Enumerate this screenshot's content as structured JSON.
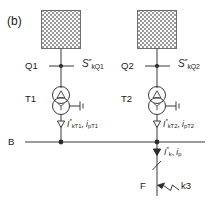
{
  "figure": {
    "panel_label": "(b)",
    "caption_absent": true
  },
  "colors": {
    "line": "#3a3a3a",
    "text": "#1a1a1a",
    "hatch": "#8a8a8a",
    "background": "#ffffff"
  },
  "sources": [
    {
      "id": "source-left",
      "network_symbol": "hatched-box",
      "node_label": "Q1",
      "power_label": {
        "symbol": "S",
        "sup": "″",
        "sub": "kQ1"
      },
      "power_label_text": "S″kQ1"
    },
    {
      "id": "source-right",
      "network_symbol": "hatched-box",
      "node_label": "Q2",
      "power_label": {
        "symbol": "S",
        "sup": "″",
        "sub": "kQ2"
      },
      "power_label_text": "S″kQ2"
    }
  ],
  "transformers": [
    {
      "id": "transformer-t1",
      "label": "T1",
      "winding_top": "delta",
      "winding_bottom": "wye",
      "earthed": true,
      "branch_current": {
        "short_circuit": {
          "symbol": "I",
          "sup": "″",
          "sub": "kT1"
        },
        "peak": {
          "symbol": "i",
          "sub": "pT1"
        },
        "text": "I″kT1, ipT1"
      }
    },
    {
      "id": "transformer-t2",
      "label": "T2",
      "winding_top": "delta",
      "winding_bottom": "wye",
      "earthed": true,
      "branch_current": {
        "short_circuit": {
          "symbol": "I",
          "sup": "″",
          "sub": "kT2"
        },
        "peak": {
          "symbol": "i",
          "sub": "pT2"
        },
        "text": "I″kT2, ipT2"
      }
    }
  ],
  "busbar": {
    "label": "B",
    "name": "busbar"
  },
  "total_current": {
    "short_circuit": {
      "symbol": "I",
      "sup": "″",
      "sub": "k"
    },
    "peak": {
      "symbol": "i",
      "sub": "p"
    },
    "text": "I″k, ip"
  },
  "fault": {
    "feeder_label": "F",
    "fault_type_label": "k3",
    "symbol": "three-phase-short-circuit"
  }
}
